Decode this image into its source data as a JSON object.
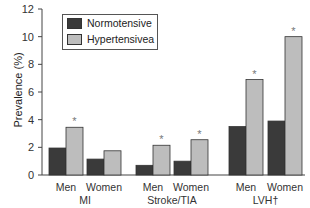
{
  "chart_data": {
    "type": "bar",
    "title": "",
    "xlabel": "",
    "ylabel": "Prevalence (%)",
    "ylim": [
      0,
      12
    ],
    "yticks": [
      0,
      2,
      4,
      6,
      8,
      10,
      12
    ],
    "grid": false,
    "legend_position": "upper-left",
    "groups": [
      {
        "label": "MI",
        "categories": [
          "Men",
          "Women"
        ]
      },
      {
        "label": "Stroke/TIA",
        "categories": [
          "Men",
          "Women"
        ]
      },
      {
        "label": "LVH†",
        "categories": [
          "Men",
          "Women"
        ]
      }
    ],
    "categories": [
      "MI Men",
      "MI Women",
      "Stroke/TIA Men",
      "Stroke/TIA Women",
      "LVH Men",
      "LVH Women"
    ],
    "series": [
      {
        "name": "Normotensive",
        "color": "#3a3a3a",
        "values": [
          1.95,
          1.15,
          0.7,
          1.0,
          3.5,
          3.9
        ]
      },
      {
        "name": "Hypertensivea",
        "color": "#bdbdbd",
        "values": [
          3.45,
          1.75,
          2.15,
          2.55,
          6.9,
          10.0
        ]
      }
    ],
    "annotations": [
      {
        "text": "*",
        "series": "Hypertensivea",
        "categories": [
          "MI Men",
          "Stroke/TIA Men",
          "Stroke/TIA Women",
          "LVH Men",
          "LVH Women"
        ]
      }
    ]
  },
  "legend": {
    "items": [
      {
        "label": "Normotensive",
        "color": "#3a3a3a"
      },
      {
        "label": "Hypertensivea",
        "color": "#bdbdbd"
      }
    ]
  },
  "axis": {
    "ylabel": "Prevalence (%)"
  }
}
